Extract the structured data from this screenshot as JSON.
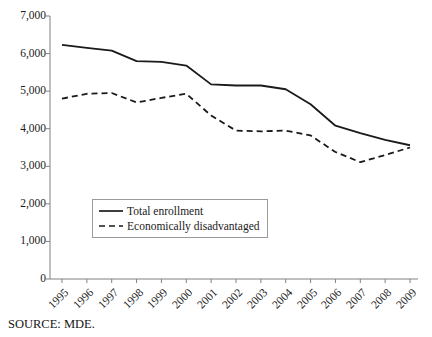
{
  "figure": {
    "source_note": "SOURCE: MDE.",
    "background_color": "#ffffff",
    "axis_color": "#808080",
    "series_color": "#1a1a1a"
  },
  "legend": {
    "position": "inside-lower-left",
    "entries": [
      {
        "label": "Total enrollment",
        "style": "solid",
        "sample": "solid-line-sample"
      },
      {
        "label": "Economically disadvantaged",
        "style": "dashed",
        "sample": "dashed-line-sample"
      }
    ]
  },
  "chart_data": {
    "type": "line",
    "title": "",
    "subtitle": "",
    "xlabel": "",
    "ylabel": "",
    "x": [
      1995,
      1996,
      1997,
      1998,
      1999,
      2000,
      2001,
      2002,
      2003,
      2004,
      2005,
      2006,
      2007,
      2008,
      2009
    ],
    "categories": [
      "1995",
      "1996",
      "1997",
      "1998",
      "1999",
      "2000",
      "2001",
      "2002",
      "2003",
      "2004",
      "2005",
      "2006",
      "2007",
      "2008",
      "2009"
    ],
    "xlim": [
      1995,
      2009
    ],
    "ylim": [
      0,
      7000
    ],
    "ytick_values": [
      0,
      1000,
      2000,
      3000,
      4000,
      5000,
      6000,
      7000
    ],
    "ytick_labels": [
      "0",
      "1,000",
      "2,000",
      "3,000",
      "4,000",
      "5,000",
      "6,000",
      "7,000"
    ],
    "grid": false,
    "legend_position": "inside-lower-left",
    "series": [
      {
        "name": "Total enrollment",
        "style": "solid",
        "color": "#1a1a1a",
        "values": [
          6230,
          6150,
          6080,
          5800,
          5780,
          5680,
          5180,
          5150,
          5150,
          5050,
          4650,
          4080,
          3880,
          3700,
          3560
        ]
      },
      {
        "name": "Economically disadvantaged",
        "style": "dashed",
        "color": "#1a1a1a",
        "values": [
          4800,
          4930,
          4950,
          4700,
          4820,
          4930,
          4350,
          3950,
          3930,
          3950,
          3820,
          3380,
          3110,
          3300,
          3500
        ]
      }
    ]
  }
}
